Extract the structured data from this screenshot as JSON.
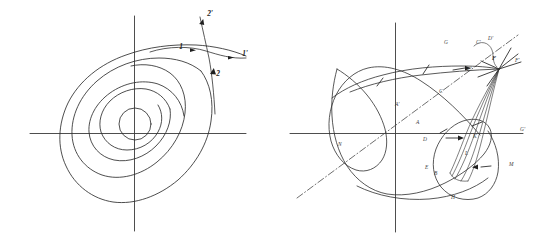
{
  "figure": {
    "background_color": "#ffffff",
    "ink_color": "#2e2e2e",
    "panels": [
      {
        "id": "left",
        "name": "nested-contour-panel",
        "description": "Four nested tilted teardrop/oval contours around a small central circle, with horizontal and vertical coordinate axes and a pair of crossing direction curves labelled 1, 1', 2, 2' at the upper right.",
        "axes": {
          "horizontal": true,
          "vertical": true
        },
        "contour_count": 4,
        "labels": [
          {
            "key": "one",
            "text": "1",
            "x": 181,
            "y": 49
          },
          {
            "key": "one_prime",
            "text": "1'",
            "x": 245,
            "y": 56
          },
          {
            "key": "two",
            "text": "2",
            "x": 216,
            "y": 74
          },
          {
            "key": "two_prime",
            "text": "2'",
            "x": 210,
            "y": 15
          }
        ]
      },
      {
        "id": "right",
        "name": "looped-curve-panel",
        "description": "A large closed curve with two cusp-like spikes (upper left and lower right), an inner narrow spindle/lens region converging to a node at the upper right, a dash-dot diagonal line of symmetry, and many small italic point labels with arrows.",
        "axes": {
          "horizontal": true,
          "vertical": true
        },
        "symmetry_line": "dash-dot diagonal from lower-left to upper-right",
        "labels": [
          {
            "key": "p01",
            "text": "A",
            "x": 141,
            "y": 124
          },
          {
            "key": "p02",
            "text": "B",
            "x": 159,
            "y": 175
          },
          {
            "key": "p03",
            "text": "C",
            "x": 164,
            "y": 93
          },
          {
            "key": "p04",
            "text": "D",
            "x": 148,
            "y": 141
          },
          {
            "key": "p05",
            "text": "E",
            "x": 150,
            "y": 169
          },
          {
            "key": "p06",
            "text": "F",
            "x": 217,
            "y": 60
          },
          {
            "key": "p07",
            "text": "G",
            "x": 169,
            "y": 44
          },
          {
            "key": "p08",
            "text": "H",
            "x": 176,
            "y": 199
          },
          {
            "key": "p09",
            "text": "A'",
            "x": 120,
            "y": 106
          },
          {
            "key": "p10",
            "text": "C'",
            "x": 201,
            "y": 44
          },
          {
            "key": "p11",
            "text": "D'",
            "x": 213,
            "y": 40
          },
          {
            "key": "p12",
            "text": "E'",
            "x": 192,
            "y": 71
          },
          {
            "key": "p13",
            "text": "F'",
            "x": 240,
            "y": 62
          },
          {
            "key": "p14",
            "text": "G'",
            "x": 245,
            "y": 131
          },
          {
            "key": "p15",
            "text": "K",
            "x": 198,
            "y": 138
          },
          {
            "key": "p16",
            "text": "L",
            "x": 190,
            "y": 155
          },
          {
            "key": "p17",
            "text": "M",
            "x": 234,
            "y": 166
          },
          {
            "key": "p18",
            "text": "N",
            "x": 63,
            "y": 146
          }
        ]
      }
    ]
  }
}
